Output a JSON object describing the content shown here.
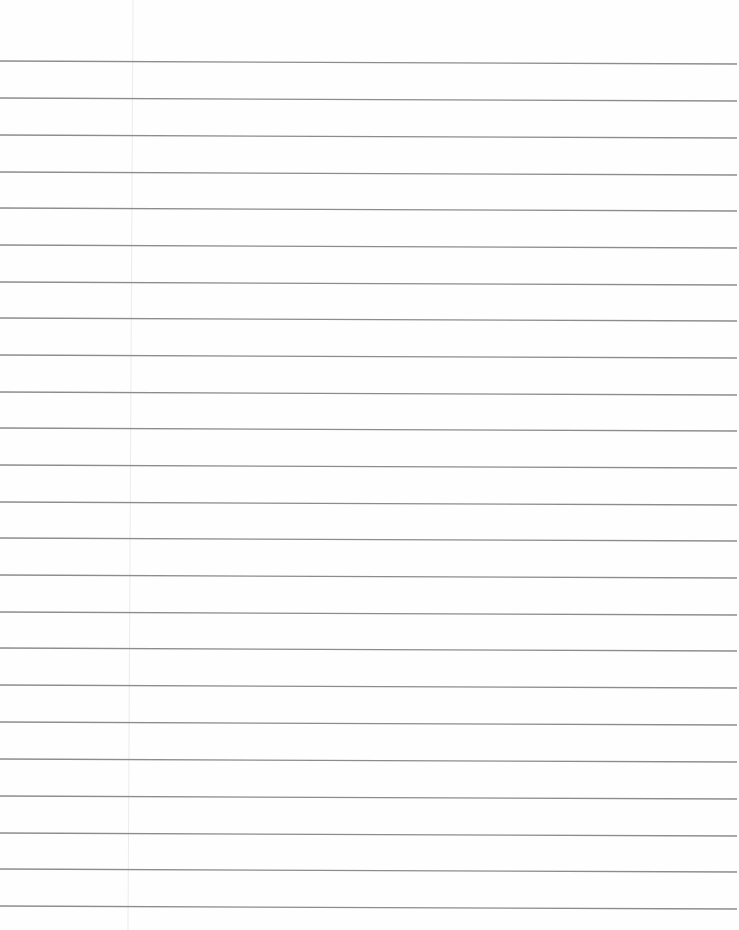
{
  "page": {
    "type": "lined-notebook-paper",
    "width": 739,
    "height": 930,
    "background_color": "#fefefe",
    "content_text": ""
  },
  "ruled_lines": {
    "count": 24,
    "color": "#8c8c8c",
    "stroke_width": 1.3,
    "x_start": 0,
    "x_end": 737,
    "slope_drop_px": 3,
    "y_left": [
      61,
      98,
      135,
      172,
      208,
      245,
      282,
      318,
      355,
      392,
      428,
      465,
      502,
      538,
      575,
      612,
      648,
      685,
      722,
      759,
      796,
      833,
      869,
      906
    ]
  },
  "margin_line": {
    "color": "#ececec",
    "stroke_width": 1,
    "x_top": 133,
    "x_bottom": 128,
    "y_top": 0,
    "y_bottom": 930
  }
}
